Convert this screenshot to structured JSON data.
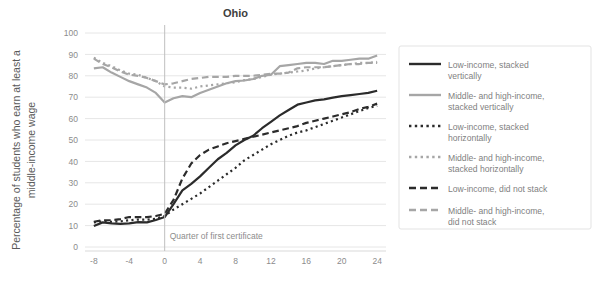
{
  "chart_data": {
    "type": "line",
    "title": "Ohio",
    "xlabel": "",
    "ylabel": "Percentage of students who earn at least a middle-income wage",
    "ylabel_lines": [
      "Percentage of students who earn at least a",
      "middle-income wage"
    ],
    "xlim": [
      -9,
      25
    ],
    "ylim": [
      0,
      100
    ],
    "ytick_step": 10,
    "yticks": [
      "0",
      "10",
      "20",
      "30",
      "40",
      "50",
      "60",
      "70",
      "80",
      "90",
      "100"
    ],
    "xticks": [
      "-8",
      "-4",
      "0",
      "4",
      "8",
      "12",
      "16",
      "20",
      "24"
    ],
    "xtick_values": [
      -8,
      -4,
      0,
      4,
      8,
      12,
      16,
      20,
      24
    ],
    "grid": "horizontal",
    "legend_position": "right",
    "annotations": [
      {
        "text": "Quarter of first certificate",
        "x": 0,
        "y": 5,
        "type": "vertical-rule-label"
      }
    ],
    "x": [
      -8,
      -7,
      -6,
      -5,
      -4,
      -3,
      -2,
      -1,
      0,
      1,
      2,
      3,
      4,
      5,
      6,
      7,
      8,
      9,
      10,
      11,
      12,
      13,
      14,
      15,
      16,
      17,
      18,
      19,
      20,
      21,
      22,
      23,
      24
    ],
    "series": [
      {
        "name": "Low-income, stacked vertically",
        "color": "#2b2b2b",
        "style": "solid",
        "width": 2.2,
        "values": [
          9.8,
          11.5,
          11.0,
          10.8,
          11.0,
          11.6,
          11.5,
          12.6,
          14.0,
          20.0,
          26.5,
          29.5,
          33.0,
          37.0,
          41.0,
          44.0,
          47.5,
          50.0,
          52.0,
          55.5,
          58.5,
          61.5,
          64.0,
          66.5,
          67.5,
          68.5,
          69.0,
          69.8,
          70.5,
          71.0,
          71.5,
          72.0,
          73.0
        ]
      },
      {
        "name": "Middle- and high-income, stacked vertically",
        "color": "#a6a6a6",
        "style": "solid",
        "width": 2.2,
        "values": [
          83.5,
          84.0,
          81.5,
          79.5,
          77.5,
          76.0,
          74.5,
          72.0,
          67.5,
          69.5,
          70.5,
          70.0,
          72.0,
          73.5,
          75.0,
          76.5,
          77.5,
          77.8,
          78.5,
          80.0,
          80.5,
          84.5,
          85.0,
          85.5,
          86.0,
          86.0,
          85.5,
          87.0,
          87.0,
          87.5,
          88.0,
          88.0,
          89.5
        ]
      },
      {
        "name": "Low-income, stacked horizontally",
        "color": "#2b2b2b",
        "style": "dotted",
        "width": 2.2,
        "values": [
          11.5,
          12.0,
          11.8,
          12.0,
          12.5,
          12.8,
          12.8,
          13.2,
          14.5,
          17.5,
          20.0,
          22.5,
          25.0,
          28.0,
          31.0,
          34.0,
          37.0,
          40.5,
          43.0,
          45.5,
          48.0,
          50.0,
          52.0,
          53.5,
          54.5,
          56.0,
          57.5,
          59.0,
          60.5,
          62.0,
          63.5,
          65.0,
          66.0
        ]
      },
      {
        "name": "Middle- and high-income, stacked horizontally",
        "color": "#a6a6a6",
        "style": "dotted",
        "width": 2.2,
        "values": [
          88.5,
          86.0,
          84.5,
          82.5,
          81.0,
          80.5,
          79.0,
          77.5,
          75.0,
          74.5,
          74.5,
          74.0,
          75.0,
          75.5,
          76.0,
          76.5,
          77.0,
          78.0,
          78.5,
          79.5,
          80.5,
          81.0,
          81.5,
          82.0,
          82.5,
          83.5,
          84.0,
          84.5,
          85.0,
          85.5,
          86.0,
          86.0,
          86.5
        ]
      },
      {
        "name": "Low-income, did not stack",
        "color": "#2b2b2b",
        "style": "dashed",
        "width": 2.2,
        "values": [
          11.8,
          12.5,
          12.5,
          13.0,
          14.0,
          14.0,
          14.0,
          14.5,
          15.5,
          22.0,
          32.0,
          39.0,
          43.0,
          45.5,
          47.0,
          48.5,
          49.5,
          50.5,
          51.5,
          52.5,
          53.5,
          54.5,
          55.5,
          56.5,
          58.0,
          59.0,
          60.0,
          61.0,
          62.0,
          63.0,
          64.5,
          65.5,
          67.0
        ]
      },
      {
        "name": "Middle- and high-income, did not stack",
        "color": "#a6a6a6",
        "style": "dashed",
        "width": 2.2,
        "values": [
          88.0,
          85.5,
          84.0,
          82.0,
          80.5,
          80.0,
          79.0,
          77.5,
          76.0,
          76.5,
          77.5,
          78.5,
          79.0,
          79.5,
          79.5,
          79.5,
          80.0,
          80.0,
          80.0,
          80.5,
          81.0,
          81.0,
          81.5,
          83.5,
          84.0,
          84.0,
          84.0,
          84.5,
          85.0,
          85.5,
          85.5,
          86.0,
          86.0
        ]
      }
    ]
  },
  "legend": {
    "items": [
      {
        "label_lines": [
          "Low-income, stacked",
          "vertically"
        ],
        "color": "#2b2b2b",
        "style": "solid"
      },
      {
        "label_lines": [
          "Middle- and high-income,",
          "stacked vertically"
        ],
        "color": "#a6a6a6",
        "style": "solid"
      },
      {
        "label_lines": [
          "Low-income, stacked",
          "horizontally"
        ],
        "color": "#2b2b2b",
        "style": "dotted"
      },
      {
        "label_lines": [
          "Middle- and high-income,",
          "stacked horizontally"
        ],
        "color": "#a6a6a6",
        "style": "dotted"
      },
      {
        "label_lines": [
          "Low-income, did not stack"
        ],
        "color": "#2b2b2b",
        "style": "dashed"
      },
      {
        "label_lines": [
          "Middle- and high-income,",
          "did not stack"
        ],
        "color": "#a6a6a6",
        "style": "dashed"
      }
    ]
  },
  "colors": {
    "low_income": "#2b2b2b",
    "middle_high_income": "#a6a6a6",
    "grid": "#e6e6e6",
    "text": "#595959",
    "tick_text": "#8c8c8c",
    "legend_border": "#e3e3e3"
  }
}
